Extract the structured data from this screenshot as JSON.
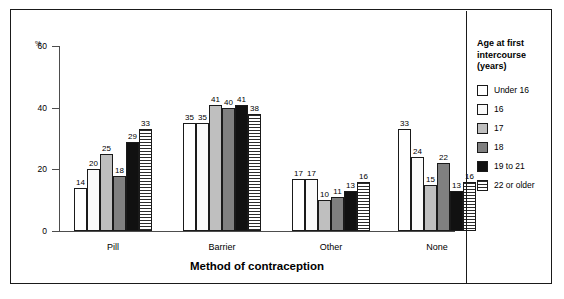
{
  "chart_data": {
    "type": "bar",
    "title": "",
    "xlabel": "Method of contraception",
    "ylabel": "%",
    "ylim": [
      0,
      60
    ],
    "yticks": [
      0,
      20,
      40,
      60
    ],
    "grid": false,
    "legend_position": "right",
    "legend_title": "Age at first\nintercourse\n(years)",
    "categories": [
      "Pill",
      "Barrier",
      "Other",
      "None"
    ],
    "series": [
      {
        "name": "Under 16",
        "values": [
          14,
          35,
          17,
          33
        ],
        "swatch": "white",
        "color": "#ffffff"
      },
      {
        "name": "16",
        "values": [
          20,
          35,
          17,
          24
        ],
        "swatch": "near-white",
        "color": "#fafafa"
      },
      {
        "name": "17",
        "values": [
          25,
          41,
          10,
          15
        ],
        "swatch": "light-gray",
        "color": "#bfbfbf"
      },
      {
        "name": "18",
        "values": [
          18,
          40,
          11,
          22
        ],
        "swatch": "medium-gray",
        "color": "#808080"
      },
      {
        "name": "19 to 21",
        "values": [
          29,
          41,
          13,
          13
        ],
        "swatch": "black",
        "color": "#111111"
      },
      {
        "name": "22 or older",
        "values": [
          33,
          38,
          16,
          16
        ],
        "swatch": "h-stripes",
        "color": "#2b2b2b"
      }
    ]
  }
}
